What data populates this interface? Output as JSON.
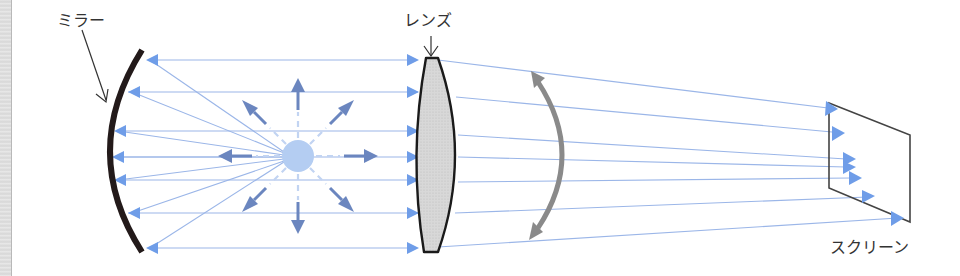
{
  "diagram": {
    "title": "",
    "labels": {
      "mirror": "ミラー",
      "lens": "レンズ",
      "screen": "スクリーン"
    },
    "colors": {
      "ray": "#9bb6e8",
      "ray_arrow": "#6f9de8",
      "source_fill": "#b4cdf2",
      "source_arrow": "#6b86bf",
      "mirror": "#231a1a",
      "lens_fill": "#d4d4d4",
      "lens_stroke": "#1a1a1a",
      "rotate_arrow": "#8a8a8a",
      "screen_stroke": "#444444",
      "label_text": "#333333"
    },
    "components": [
      {
        "id": "mirror",
        "type": "concave-mirror",
        "label": "ミラー"
      },
      {
        "id": "light-source",
        "type": "point-source"
      },
      {
        "id": "lens",
        "type": "convex-lens",
        "label": "レンズ"
      },
      {
        "id": "rotation-indicator",
        "type": "double-headed-curved-arrow"
      },
      {
        "id": "screen",
        "type": "screen",
        "label": "スクリーン"
      }
    ],
    "ray_rows_y": [
      60,
      92,
      131,
      157,
      180,
      213,
      248
    ]
  }
}
